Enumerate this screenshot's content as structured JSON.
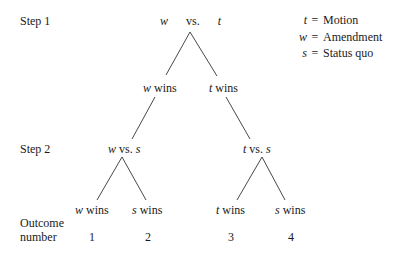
{
  "steps": {
    "step1_label": "Step 1",
    "step2_label": "Step 2"
  },
  "root": {
    "left": "w",
    "vs": "vs.",
    "right": "t"
  },
  "level1": [
    {
      "var": "w",
      "text": "wins"
    },
    {
      "var": "t",
      "text": "wins"
    }
  ],
  "level2": [
    {
      "left": "w",
      "vs": "vs.",
      "right": "s"
    },
    {
      "left": "t",
      "vs": "vs.",
      "right": "s"
    }
  ],
  "leaves": [
    {
      "var": "w",
      "text": "wins",
      "outcome": "1"
    },
    {
      "var": "s",
      "text": "wins",
      "outcome": "2"
    },
    {
      "var": "t",
      "text": "wins",
      "outcome": "3"
    },
    {
      "var": "s",
      "text": "wins",
      "outcome": "4"
    }
  ],
  "outcome_label": {
    "line1": "Outcome",
    "line2": "number"
  },
  "legend": [
    {
      "var": "t",
      "eq": "=",
      "meaning": "Motion"
    },
    {
      "var": "w",
      "eq": "=",
      "meaning": "Amendment"
    },
    {
      "var": "s",
      "eq": "=",
      "meaning": "Status quo"
    }
  ],
  "colors": {
    "ink": "#1a1a1a",
    "background": "#ffffff"
  }
}
